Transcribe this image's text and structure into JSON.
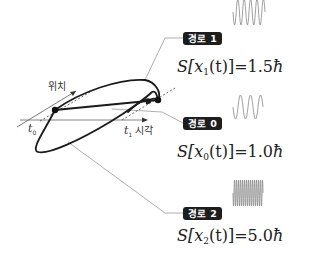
{
  "diagram": {
    "axes": {
      "position_label": "위치",
      "time_label": "시각",
      "t0_label": "t",
      "t0_sub": "0",
      "t1_label": "t",
      "t1_sub": "1"
    },
    "paths": [
      {
        "tag": "경로 1",
        "formula_prefix": "S[x",
        "formula_sub": "1",
        "formula_suffix": "(t)]=1.5",
        "formula_unit": "ħ",
        "wave": "medium-frequency-sine",
        "action_value": 1.5
      },
      {
        "tag": "경로 0",
        "formula_prefix": "S[x",
        "formula_sub": "0",
        "formula_suffix": "(t)]=1.0",
        "formula_unit": "ħ",
        "wave": "low-frequency-sine",
        "action_value": 1.0
      },
      {
        "tag": "경로 2",
        "formula_prefix": "S[x",
        "formula_sub": "2",
        "formula_suffix": "(t)]=5.0",
        "formula_unit": "ħ",
        "wave": "high-frequency-sine",
        "action_value": 5.0
      }
    ],
    "colors": {
      "curve": "#1a1a1a",
      "axis": "#555555",
      "leader": "#999999",
      "tag_bg": "#1d1d1d",
      "wave": "#888888"
    }
  }
}
